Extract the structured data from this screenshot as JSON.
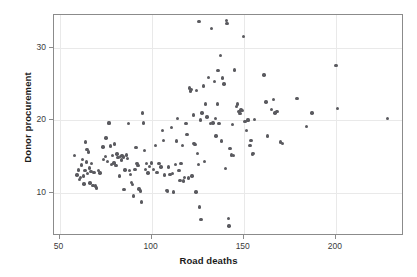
{
  "chart_data": {
    "type": "scatter",
    "title": "",
    "xlabel": "Road deaths",
    "ylabel": "Donor procurement",
    "xlim": [
      47,
      237
    ],
    "ylim": [
      4.0,
      34.5
    ],
    "xticks": [
      50,
      100,
      150,
      200
    ],
    "xtick_labels": [
      "50",
      "100",
      "150",
      "200"
    ],
    "yticks": [
      10,
      20,
      30
    ],
    "ytick_labels": [
      "10",
      "20",
      "30"
    ],
    "grid": true,
    "grid_color": "#e9e9e9",
    "legend": null,
    "marker_color": "#5a5a5f",
    "marker_shape": "circle",
    "frame_color": "#8b8b8b",
    "points": [
      [
        58.0,
        15.1
      ],
      [
        59.5,
        12.4
      ],
      [
        60.2,
        13.1
      ],
      [
        60.8,
        11.8
      ],
      [
        61.5,
        12.1
      ],
      [
        62.0,
        13.8
      ],
      [
        62.4,
        14.6
      ],
      [
        63.0,
        12.3
      ],
      [
        63.2,
        11.2
      ],
      [
        63.8,
        13.0
      ],
      [
        64.0,
        17.0
      ],
      [
        64.6,
        14.2
      ],
      [
        65.0,
        15.9
      ],
      [
        65.3,
        12.6
      ],
      [
        65.8,
        15.6
      ],
      [
        66.2,
        13.4
      ],
      [
        66.5,
        11.3
      ],
      [
        67.0,
        12.9
      ],
      [
        67.5,
        14.0
      ],
      [
        68.2,
        11.0
      ],
      [
        68.8,
        12.8
      ],
      [
        69.5,
        10.9
      ],
      [
        70.2,
        10.6
      ],
      [
        71.0,
        13.0
      ],
      [
        72.0,
        12.7
      ],
      [
        73.5,
        16.3
      ],
      [
        74.0,
        14.6
      ],
      [
        74.8,
        15.0
      ],
      [
        75.2,
        17.5
      ],
      [
        76.0,
        14.3
      ],
      [
        76.5,
        19.6
      ],
      [
        77.0,
        19.6
      ],
      [
        77.8,
        16.4
      ],
      [
        78.2,
        13.9
      ],
      [
        78.8,
        15.1
      ],
      [
        79.5,
        14.1
      ],
      [
        80.0,
        16.7
      ],
      [
        80.6,
        13.7
      ],
      [
        81.2,
        15.3
      ],
      [
        81.8,
        14.8
      ],
      [
        82.4,
        12.3
      ],
      [
        83.0,
        15.0
      ],
      [
        83.5,
        14.5
      ],
      [
        84.0,
        15.1
      ],
      [
        84.6,
        14.9
      ],
      [
        85.0,
        10.4
      ],
      [
        85.6,
        13.1
      ],
      [
        86.2,
        15.2
      ],
      [
        86.8,
        14.7
      ],
      [
        87.4,
        19.5
      ],
      [
        88.0,
        13.0
      ],
      [
        88.6,
        12.5
      ],
      [
        89.0,
        11.4
      ],
      [
        89.6,
        11.1
      ],
      [
        90.2,
        9.5
      ],
      [
        91.0,
        13.2
      ],
      [
        91.6,
        16.2
      ],
      [
        92.0,
        14.0
      ],
      [
        92.6,
        13.7
      ],
      [
        93.2,
        10.5
      ],
      [
        93.8,
        10.2
      ],
      [
        94.5,
        8.7
      ],
      [
        95.0,
        21.0
      ],
      [
        95.5,
        19.6
      ],
      [
        96.0,
        15.8
      ],
      [
        96.6,
        13.2
      ],
      [
        97.2,
        14.0
      ],
      [
        98.0,
        12.7
      ],
      [
        99.0,
        13.6
      ],
      [
        100.0,
        14.1
      ],
      [
        101.0,
        13.2
      ],
      [
        102.0,
        16.5
      ],
      [
        103.0,
        12.8
      ],
      [
        104.0,
        14.0
      ],
      [
        105.0,
        13.5
      ],
      [
        106.0,
        18.6
      ],
      [
        106.5,
        17.2
      ],
      [
        107.0,
        12.4
      ],
      [
        108.0,
        10.3
      ],
      [
        108.6,
        10.2
      ],
      [
        109.2,
        13.5
      ],
      [
        110.0,
        12.5
      ],
      [
        110.8,
        19.0
      ],
      [
        111.4,
        12.6
      ],
      [
        112.0,
        10.1
      ],
      [
        112.8,
        13.9
      ],
      [
        113.4,
        17.1
      ],
      [
        114.0,
        20.2
      ],
      [
        114.8,
        13.0
      ],
      [
        115.4,
        11.7
      ],
      [
        116.0,
        14.0
      ],
      [
        116.8,
        16.5
      ],
      [
        117.4,
        11.6
      ],
      [
        118.0,
        12.1
      ],
      [
        118.6,
        19.5
      ],
      [
        119.2,
        18.0
      ],
      [
        120.0,
        12.0
      ],
      [
        120.6,
        24.4
      ],
      [
        121.0,
        24.0
      ],
      [
        121.6,
        24.2
      ],
      [
        122.0,
        12.3
      ],
      [
        122.6,
        20.7
      ],
      [
        123.0,
        16.8
      ],
      [
        123.6,
        16.6
      ],
      [
        124.0,
        10.1
      ],
      [
        124.5,
        24.1
      ],
      [
        125.0,
        15.4
      ],
      [
        125.4,
        13.9
      ],
      [
        125.8,
        33.6
      ],
      [
        126.0,
        8.0
      ],
      [
        126.4,
        20.0
      ],
      [
        126.8,
        6.3
      ],
      [
        127.4,
        21.0
      ],
      [
        128.0,
        24.7
      ],
      [
        128.6,
        14.3
      ],
      [
        129.4,
        22.2
      ],
      [
        130.0,
        20.4
      ],
      [
        131.0,
        25.9
      ],
      [
        132.0,
        19.5
      ],
      [
        132.6,
        32.6
      ],
      [
        133.4,
        19.6
      ],
      [
        134.0,
        25.3
      ],
      [
        134.6,
        20.2
      ],
      [
        135.0,
        17.8
      ],
      [
        135.6,
        22.2
      ],
      [
        136.0,
        26.8
      ],
      [
        136.6,
        19.5
      ],
      [
        137.4,
        28.9
      ],
      [
        138.0,
        17.1
      ],
      [
        138.6,
        25.8
      ],
      [
        139.2,
        25.0
      ],
      [
        140.0,
        13.3
      ],
      [
        140.6,
        33.7
      ],
      [
        141.0,
        33.3
      ],
      [
        141.6,
        6.4
      ],
      [
        142.0,
        5.4
      ],
      [
        142.6,
        16.1
      ],
      [
        143.4,
        15.2
      ],
      [
        144.0,
        19.4
      ],
      [
        144.6,
        15.1
      ],
      [
        145.0,
        26.9
      ],
      [
        146.0,
        21.9
      ],
      [
        146.6,
        22.2
      ],
      [
        147.4,
        21.2
      ],
      [
        148.0,
        20.9
      ],
      [
        148.6,
        21.4
      ],
      [
        149.4,
        21.3
      ],
      [
        150.0,
        31.5
      ],
      [
        150.6,
        19.8
      ],
      [
        151.4,
        18.6
      ],
      [
        152.0,
        20.0
      ],
      [
        152.6,
        20.0
      ],
      [
        153.4,
        16.5
      ],
      [
        154.0,
        17.2
      ],
      [
        154.6,
        15.3
      ],
      [
        155.2,
        15.4
      ],
      [
        156.0,
        20.1
      ],
      [
        161.0,
        26.2
      ],
      [
        162.0,
        22.5
      ],
      [
        163.0,
        17.8
      ],
      [
        165.0,
        21.5
      ],
      [
        166.0,
        22.8
      ],
      [
        167.0,
        21.0
      ],
      [
        168.0,
        21.2
      ],
      [
        170.0,
        17.0
      ],
      [
        171.0,
        16.8
      ],
      [
        179.0,
        23.0
      ],
      [
        184.0,
        19.1
      ],
      [
        187.0,
        21.0
      ],
      [
        200.0,
        27.5
      ],
      [
        201.0,
        21.6
      ],
      [
        228.0,
        20.2
      ]
    ]
  }
}
